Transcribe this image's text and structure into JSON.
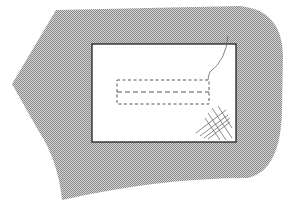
{
  "diagram": {
    "title": "",
    "colors": {
      "background": "#ffffff",
      "fabric_pattern_dark": "#8a8a8a",
      "fabric_pattern_light": "#d4d4d4",
      "outline": "#222222",
      "dashed_stitch": "#555555",
      "thread": "#666666"
    },
    "elements": [
      {
        "name": "fabric-piece",
        "type": "shaded-shape"
      },
      {
        "name": "patch-rectangle",
        "type": "rectangle"
      },
      {
        "name": "basting-stitch-box",
        "type": "dashed-rectangle"
      },
      {
        "name": "center-stitch-line",
        "type": "dashed-line"
      },
      {
        "name": "thread",
        "type": "curve"
      },
      {
        "name": "corner-crosshatch",
        "type": "hatch"
      }
    ],
    "labels": []
  }
}
